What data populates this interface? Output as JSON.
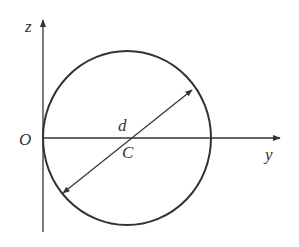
{
  "diagram": {
    "type": "geometry",
    "labels": {
      "z_axis": "z",
      "y_axis": "y",
      "origin": "O",
      "center": "C",
      "diameter": "d"
    },
    "colors": {
      "stroke": "#333333",
      "background": "#ffffff"
    },
    "geometry": {
      "origin": [
        43,
        138
      ],
      "circle_center": [
        127,
        138
      ],
      "circle_rx": 84,
      "circle_ry": 87,
      "z_axis_top": [
        43,
        18
      ],
      "y_axis_end": [
        280,
        138
      ],
      "diameter_start": [
        63,
        193
      ],
      "diameter_end": [
        192,
        90
      ]
    }
  }
}
